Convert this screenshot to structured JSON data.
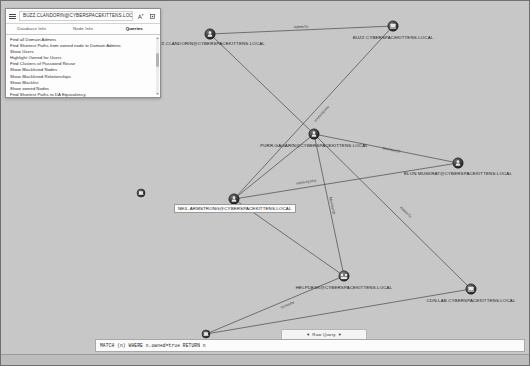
{
  "app": {
    "name": "BloodHound",
    "canvas_bg": "#c7c7c7"
  },
  "side_panel": {
    "search": {
      "value": "BUZZ.CLANDORIN@CYBERSPACEKITTENS.LOCAL",
      "placeholder": "Search Nodes"
    },
    "menu_icon": "hamburger-icon",
    "pathfinding_icon": "pathfinding-icon",
    "settings_icon": "gear-icon",
    "tabs": [
      {
        "label": "Database Info",
        "active": false
      },
      {
        "label": "Node Info",
        "active": false
      },
      {
        "label": "Queries",
        "active": true
      }
    ],
    "queries": [
      "Find all Domain Admins",
      "Find Shortest Paths from owned node to Domain Admins",
      "Show Users",
      "Highlight Owned for Users",
      "Find Clusters of Password Reuse",
      "Show Blacklisted Nodes",
      "Show Blacklisted Relationships",
      "Show Blacklist",
      "Show owned Nodes",
      "Find Shortest Paths to DA Equivalency"
    ]
  },
  "graph": {
    "nodes": [
      {
        "id": "jizz-clandorin",
        "label": "JIZZ.CLANDORIN@CYBERSPACEKITTENS.LOCAL",
        "type": "user",
        "x": 209,
        "y": 33,
        "label_x": 209,
        "label_y": 44,
        "owned": true,
        "highlight": false
      },
      {
        "id": "buzz-computer",
        "label": "BUZZ.CYBERSPACEKITTENS.LOCAL",
        "type": "computer",
        "x": 392,
        "y": 25,
        "label_x": 392,
        "label_y": 38,
        "owned": true,
        "highlight": false
      },
      {
        "id": "purr-gagarin",
        "label": "PURR.GAGARIN@CYBERSPACEKITTENS.LOCAL",
        "type": "user",
        "x": 313,
        "y": 133,
        "label_x": 313,
        "label_y": 146,
        "owned": true,
        "highlight": false
      },
      {
        "id": "elon-muskrat",
        "label": "ELON.MUSKRAT@CYBERSPACEKITTENS.LOCAL",
        "type": "user",
        "x": 457,
        "y": 162,
        "label_x": 457,
        "label_y": 174,
        "owned": true,
        "highlight": false
      },
      {
        "id": "neil-armstrong",
        "label": "NEIL.ARMSTRONG@CYBERSPACEKITTENS.LOCAL",
        "type": "user",
        "x": 233,
        "y": 198,
        "label_x": 233,
        "label_y": 210,
        "owned": true,
        "highlight": true
      },
      {
        "id": "helpdesk",
        "label": "HELPDESK@CYBERSPACEKITTENS.LOCAL",
        "type": "group",
        "x": 343,
        "y": 275,
        "label_x": 343,
        "label_y": 288,
        "owned": true,
        "highlight": false
      },
      {
        "id": "cdn-lab",
        "label": "CDN-LAB.CYBERSPACEKITTENS.LOCAL",
        "type": "computer",
        "x": 470,
        "y": 288,
        "label_x": 470,
        "label_y": 301,
        "owned": true,
        "highlight": false
      },
      {
        "id": "small-node-left",
        "label": "",
        "type": "computer",
        "x": 140,
        "y": 192,
        "label_x": 140,
        "label_y": 202,
        "owned": true,
        "highlight": false
      },
      {
        "id": "small-node-bottom",
        "label": "",
        "type": "computer",
        "x": 205,
        "y": 333,
        "label_x": 205,
        "label_y": 343,
        "owned": true,
        "highlight": false
      }
    ],
    "edges": [
      {
        "from": "jizz-clandorin",
        "to": "buzz-computer",
        "label": "AdminTo",
        "label_x": 300,
        "label_y": 27
      },
      {
        "from": "jizz-clandorin",
        "to": "purr-gagarin",
        "label": "",
        "label_x": 0,
        "label_y": 0
      },
      {
        "from": "buzz-computer",
        "to": "neil-armstrong",
        "label": "HasSession",
        "label_x": 320,
        "label_y": 112
      },
      {
        "from": "purr-gagarin",
        "to": "elon-muskrat",
        "label": "MemberOf",
        "label_x": 390,
        "label_y": 150
      },
      {
        "from": "purr-gagarin",
        "to": "neil-armstrong",
        "label": "",
        "label_x": 0,
        "label_y": 0
      },
      {
        "from": "purr-gagarin",
        "to": "helpdesk",
        "label": "MemberOf",
        "label_x": 330,
        "label_y": 205
      },
      {
        "from": "purr-gagarin",
        "to": "cdn-lab",
        "label": "AdminTo",
        "label_x": 404,
        "label_y": 212
      },
      {
        "from": "neil-armstrong",
        "to": "helpdesk",
        "label": "",
        "label_x": 0,
        "label_y": 0
      },
      {
        "from": "helpdesk",
        "to": "small-node-bottom",
        "label": "AdminTo",
        "label_x": 286,
        "label_y": 303
      },
      {
        "from": "small-node-bottom",
        "to": "cdn-lab",
        "label": "",
        "label_x": 0,
        "label_y": 0
      },
      {
        "from": "elon-muskrat",
        "to": "neil-armstrong",
        "label": "HasSession",
        "label_x": 305,
        "label_y": 180
      }
    ]
  },
  "query_bar": {
    "raw_query_label": "Raw Query",
    "caret_left": "▼",
    "caret_right": "▼",
    "query_value": "MATCH (n) WHERE n.owned=true RETURN n",
    "placeholder": "Enter a Cypher query"
  }
}
